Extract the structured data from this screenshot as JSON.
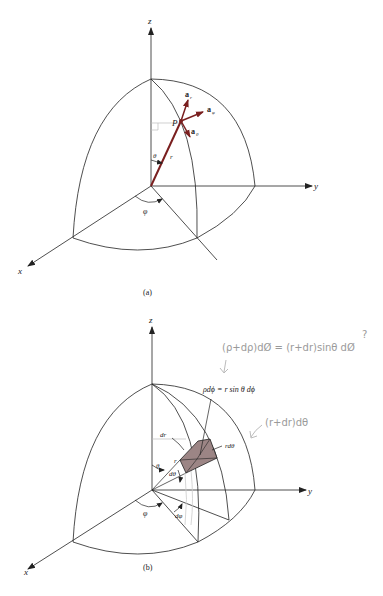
{
  "figure_a": {
    "caption": "(a)",
    "axis_labels": {
      "x": "x",
      "y": "y",
      "z": "z"
    },
    "point_label": "P",
    "radius_label": "r",
    "theta_label": "θ",
    "phi_label": "φ",
    "unit_vectors": {
      "r": "a",
      "r_sub": "r",
      "phi": "a",
      "phi_sub": "φ",
      "theta": "a",
      "theta_sub": "θ"
    }
  },
  "figure_b": {
    "caption": "(b)",
    "axis_labels": {
      "x": "x",
      "y": "y",
      "z": "z"
    },
    "labels": {
      "dr": "dr",
      "r": "r",
      "theta": "θ",
      "dtheta": "dθ",
      "phi": "φ",
      "dphi": "dφ",
      "rdtheta": "rdθ",
      "rho_dphi": "ρdϕ = r sin θ dϕ"
    },
    "handwritten": {
      "top_note": "(ρ+dρ)dØ = (r+dr)sinθ dØ",
      "question_mark": "?",
      "side_note": "(r+dr)dθ"
    }
  },
  "colors": {
    "line": "#222222",
    "vector": "#7a1f1f",
    "volume_fill": "#9c8585",
    "handwriting": "#9a9a9a"
  }
}
